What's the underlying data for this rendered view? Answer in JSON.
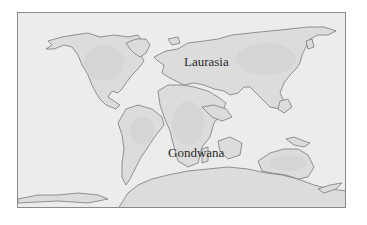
{
  "map": {
    "type": "paleogeographic world map",
    "labels": {
      "laurasia": "Laurasia",
      "gondwana": "Gondwana"
    },
    "colors": {
      "ocean": "#ececec",
      "land_shelf": "#e2e2e2",
      "land_core": "#d9d9d9",
      "coastline": "#7a7a7a",
      "frame_border": "#8a8a8a",
      "label_text": "#2a2a2a"
    }
  }
}
